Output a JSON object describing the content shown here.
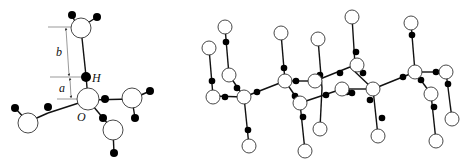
{
  "left_diagram": {
    "title": "Hydrogen bond geometry",
    "labels": {
      "b": "b",
      "a": "a",
      "H": "H",
      "O": "O"
    }
  },
  "right_diagram": {
    "title": "Ice lattice network"
  },
  "legend": {
    "oxygen": "open circle",
    "hydrogen": "filled dot"
  }
}
